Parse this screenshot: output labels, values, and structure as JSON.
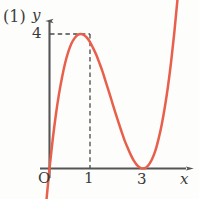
{
  "figure": {
    "number_label": "(1)",
    "background_color": "#fdfdfc",
    "curve_color": "#e8604c",
    "axis_color": "#555555",
    "dashed_color": "#4a4a4a"
  },
  "axes": {
    "y_label": "y",
    "x_label": "x",
    "origin_label": "O"
  },
  "chart_data": {
    "type": "line",
    "title": "(1)",
    "xlabel": "x",
    "ylabel": "y",
    "equation": "y = x(x - 3)^2",
    "xlim": [
      -0.2,
      4.5
    ],
    "ylim": [
      -1.2,
      6.0
    ],
    "grid": false,
    "legend": null,
    "x_tick_labels": [
      "O",
      "1",
      "3"
    ],
    "x_tick_values": [
      0,
      1,
      3
    ],
    "y_tick_labels": [
      "4"
    ],
    "y_tick_values": [
      4
    ],
    "annotations": [
      {
        "text": "4",
        "type": "dashed-guide-horizontal",
        "y": 4,
        "from_x": 0,
        "to_x": 1
      },
      {
        "text": "1",
        "type": "dashed-guide-vertical",
        "x": 1,
        "from_y": 0,
        "to_y": 4
      }
    ],
    "features": [
      {
        "kind": "root",
        "x": 0,
        "y": 0
      },
      {
        "kind": "local-maximum",
        "x": 1,
        "y": 4
      },
      {
        "kind": "local-minimum",
        "x": 3,
        "y": 0
      },
      {
        "kind": "double-root",
        "x": 3,
        "y": 0
      }
    ],
    "series": [
      {
        "name": "y = x(x - 3)^2",
        "color": "#e8604c",
        "x": [
          -0.3,
          -0.2,
          -0.1,
          0.0,
          0.1,
          0.2,
          0.3,
          0.4,
          0.5,
          0.6,
          0.7,
          0.8,
          0.9,
          1.0,
          1.1,
          1.2,
          1.3,
          1.4,
          1.5,
          1.6,
          1.7,
          1.8,
          1.9,
          2.0,
          2.1,
          2.2,
          2.3,
          2.4,
          2.5,
          2.6,
          2.7,
          2.8,
          2.9,
          3.0,
          3.1,
          3.2,
          3.3,
          3.4,
          3.5,
          3.6,
          3.7,
          3.8,
          3.9,
          4.0,
          4.1,
          4.2
        ],
        "y": [
          -3.27,
          -2.05,
          -0.96,
          0.0,
          0.84,
          1.57,
          2.19,
          2.7,
          3.13,
          3.46,
          3.71,
          3.87,
          3.97,
          4.0,
          3.97,
          3.89,
          3.76,
          3.58,
          3.38,
          3.14,
          2.89,
          2.59,
          2.3,
          2.0,
          1.7,
          1.41,
          1.13,
          0.86,
          0.63,
          0.42,
          0.24,
          0.11,
          0.03,
          0.0,
          0.03,
          0.13,
          0.3,
          0.54,
          0.88,
          1.3,
          1.82,
          2.43,
          3.16,
          4.0,
          4.96,
          6.05
        ]
      }
    ]
  }
}
